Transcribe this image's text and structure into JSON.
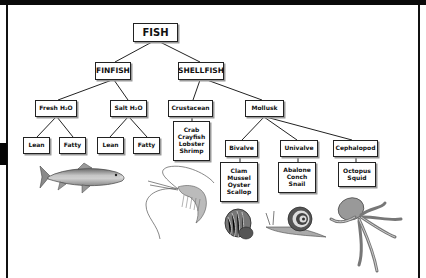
{
  "diagram": {
    "type": "tree",
    "root": "FISH",
    "nodes": {
      "fish": "FISH",
      "finfish": "FINFISH",
      "shellfish": "SHELLFISH",
      "fresh": "Fresh H₂O",
      "salt": "Salt H₂O",
      "crustacean": "Crustacean",
      "mollusk": "Mollusk",
      "fresh_lean": "Lean",
      "fresh_fatty": "Fatty",
      "salt_lean": "Lean",
      "salt_fatty": "Fatty",
      "bivalve": "Bivalve",
      "univalve": "Univalve",
      "cephalopod": "Cephalopod"
    },
    "lists": {
      "crustacean_items": "Crab\nCrayfish\nLobster\nShrimp",
      "bivalve_items": "Clam\nMussel\nOyster\nScallop",
      "univalve_items": "Abalone\nConch\nSnail",
      "cephalopod_items": "Octopus\nSquid"
    },
    "edges": [
      [
        "FISH",
        "FINFISH"
      ],
      [
        "FISH",
        "SHELLFISH"
      ],
      [
        "FINFISH",
        "Fresh H2O"
      ],
      [
        "FINFISH",
        "Salt H2O"
      ],
      [
        "SHELLFISH",
        "Crustacean"
      ],
      [
        "SHELLFISH",
        "Mollusk"
      ],
      [
        "Fresh H2O",
        "Lean"
      ],
      [
        "Fresh H2O",
        "Fatty"
      ],
      [
        "Salt H2O",
        "Lean"
      ],
      [
        "Salt H2O",
        "Fatty"
      ],
      [
        "Crustacean",
        "Crab/Crayfish/Lobster/Shrimp"
      ],
      [
        "Mollusk",
        "Bivalve"
      ],
      [
        "Mollusk",
        "Univalve"
      ],
      [
        "Mollusk",
        "Cephalopod"
      ],
      [
        "Bivalve",
        "Clam/Mussel/Oyster/Scallop"
      ],
      [
        "Univalve",
        "Abalone/Conch/Snail"
      ],
      [
        "Cephalopod",
        "Octopus/Squid"
      ]
    ],
    "illustrations": [
      "fish",
      "shrimp",
      "scallop-shell",
      "snail",
      "octopus"
    ]
  }
}
